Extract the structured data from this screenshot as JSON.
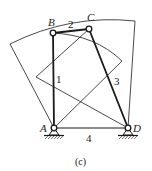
{
  "figure": {
    "caption": "(c)",
    "joints": {
      "A": {
        "label": "A",
        "x": 54,
        "y": 128
      },
      "B": {
        "label": "B",
        "x": 53,
        "y": 33
      },
      "C": {
        "label": "C",
        "x": 89,
        "y": 29
      },
      "D": {
        "label": "D",
        "x": 128,
        "y": 128
      }
    },
    "links": [
      {
        "id": "1",
        "label": "1",
        "from": "A",
        "to": "B"
      },
      {
        "id": "2",
        "label": "2",
        "from": "B",
        "to": "C"
      },
      {
        "id": "3",
        "label": "3",
        "from": "C",
        "to": "D"
      },
      {
        "id": "4",
        "label": "4",
        "from": "A",
        "to": "D"
      }
    ],
    "colors": {
      "stroke": "#1a1a1a",
      "background": "#ffffff"
    }
  }
}
